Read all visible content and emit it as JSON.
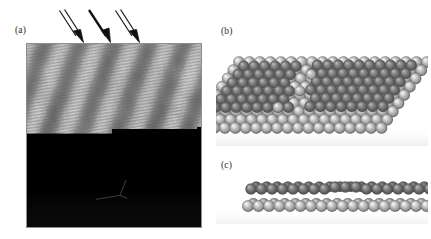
{
  "figure": {
    "type": "scientific-figure",
    "background_color": "#ffffff",
    "width": 431,
    "height": 239
  },
  "panels": [
    {
      "id": "a",
      "label": "(a)",
      "kind": "stm-image",
      "description": "Grey-scale STM topograph showing diagonal stripe domains with fine atomic-row corrugation",
      "frame": {
        "x": 26,
        "y": 43,
        "width": 176,
        "height": 185
      },
      "frame_border_color": "#8d8d8d",
      "stripe_count": 5,
      "stripe_tilt_deg": 20,
      "bright_color": "#e8e8e8",
      "dark_color": "#8a8a8a",
      "mid_color": "#b5b5b5",
      "markers": [
        {
          "name": "unit-cell-marker",
          "shape": "bent-line",
          "x": 118,
          "y": 183,
          "color": "#3a3a3a"
        }
      ]
    },
    {
      "id": "b",
      "label": "(b)",
      "kind": "ball-model-top-view",
      "description": "Hard-sphere model, plan view: parallelogram substrate slab of light spheres with darker adsorbate spheres forming two domains separated by a domain wall",
      "frame": {
        "x": 216,
        "y": 42,
        "width": 212,
        "height": 104
      },
      "substrate_sphere_color": "#d4d4d4",
      "adsorbate_sphere_color": "#8f8f8f",
      "highlight_color": "#f4f4f4",
      "shadow_color": "#6e6e6e",
      "rows": 9,
      "columns": 19
    },
    {
      "id": "c",
      "label": "(c)",
      "kind": "ball-model-side-view",
      "description": "Hard-sphere model, side (edge-on) view: a single light substrate row with a darker adsorbate row above it",
      "frame": {
        "x": 216,
        "y": 172,
        "width": 212,
        "height": 52
      },
      "substrate_sphere_color": "#d4d4d4",
      "adsorbate_sphere_color": "#8f8f8f",
      "highlight_color": "#f4f4f4",
      "shadow_color": "#6e6e6e",
      "rows": 2,
      "columns": 18
    }
  ],
  "annotations": {
    "arrows": [
      {
        "name": "arrow-1",
        "style": "outline",
        "x": 57,
        "y": 9,
        "length": 33,
        "angle_deg": 62,
        "color": "#111111"
      },
      {
        "name": "arrow-2",
        "style": "solid",
        "x": 86,
        "y": 9,
        "length": 33,
        "angle_deg": 62,
        "color": "#111111"
      },
      {
        "name": "arrow-3",
        "style": "outline",
        "x": 113,
        "y": 9,
        "length": 33,
        "angle_deg": 62,
        "color": "#111111"
      }
    ]
  }
}
